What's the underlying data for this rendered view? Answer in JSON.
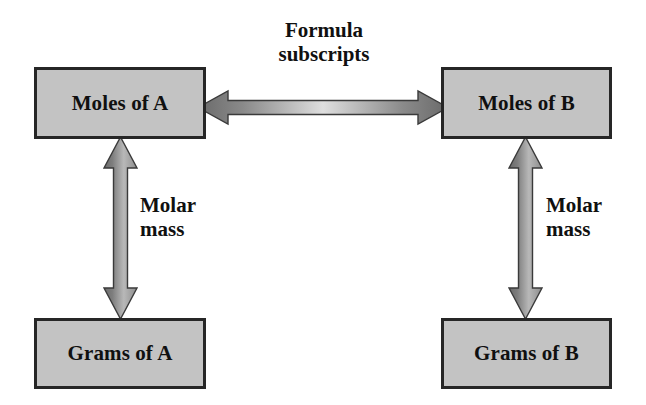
{
  "diagram": {
    "canvas": {
      "width": 646,
      "height": 405,
      "background": "#ffffff"
    },
    "palette": {
      "box_fill": "#c3c3c3",
      "box_border": "#262626",
      "text": "#101010",
      "arrow_dark": "#6e6e6e",
      "arrow_light": "#d2d2d2",
      "arrow_outline": "#3a3a3a"
    },
    "nodes": [
      {
        "id": "moles-a",
        "label": "Moles of A"
      },
      {
        "id": "moles-b",
        "label": "Moles of B"
      },
      {
        "id": "grams-a",
        "label": "Grams of A"
      },
      {
        "id": "grams-b",
        "label": "Grams of B"
      }
    ],
    "connections": [
      {
        "id": "moles-a-to-moles-b",
        "from": "moles-a",
        "to": "moles-b",
        "direction": "bidirectional",
        "orientation": "horizontal",
        "label_line1": "Formula",
        "label_line2": "subscripts"
      },
      {
        "id": "moles-a-to-grams-a",
        "from": "moles-a",
        "to": "grams-a",
        "direction": "bidirectional",
        "orientation": "vertical",
        "label_line1": "Molar",
        "label_line2": "mass"
      },
      {
        "id": "moles-b-to-grams-b",
        "from": "moles-b",
        "to": "grams-b",
        "direction": "bidirectional",
        "orientation": "vertical",
        "label_line1": "Molar",
        "label_line2": "mass"
      }
    ]
  }
}
